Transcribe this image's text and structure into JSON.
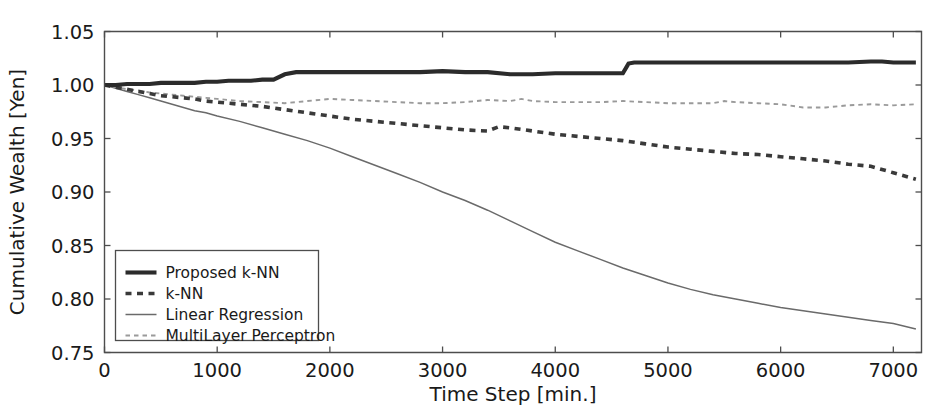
{
  "chart_data": {
    "type": "line",
    "title": "",
    "xlabel": "Time Step [min.]",
    "ylabel": "Cumulative Wealth [Yen]",
    "xlim": [
      0,
      7250
    ],
    "ylim": [
      0.75,
      1.05
    ],
    "xticks": [
      0,
      1000,
      2000,
      3000,
      4000,
      5000,
      6000,
      7000
    ],
    "xticklabels": [
      "0",
      "1000",
      "2000",
      "3000",
      "4000",
      "5000",
      "6000",
      "7000"
    ],
    "yticks": [
      0.75,
      0.8,
      0.85,
      0.9,
      0.95,
      1.0,
      1.05
    ],
    "yticklabels": [
      "0.75",
      "0.80",
      "0.85",
      "0.90",
      "0.95",
      "1.00",
      "1.05"
    ],
    "grid": false,
    "legend_position": "lower left",
    "series": [
      {
        "name": "Proposed k-NN",
        "style": "solid-thick",
        "color": "#2b2b2b",
        "x": [
          0,
          100,
          200,
          300,
          400,
          500,
          600,
          700,
          800,
          900,
          1000,
          1100,
          1200,
          1300,
          1400,
          1500,
          1600,
          1700,
          1800,
          1900,
          2000,
          2200,
          2400,
          2600,
          2800,
          3000,
          3200,
          3400,
          3600,
          3800,
          4000,
          4200,
          4400,
          4600,
          4650,
          4700,
          4800,
          5000,
          5200,
          5400,
          5600,
          5800,
          6000,
          6200,
          6400,
          6600,
          6800,
          6900,
          7000,
          7100,
          7200
        ],
        "y": [
          1.0,
          1.0,
          1.001,
          1.001,
          1.001,
          1.002,
          1.002,
          1.002,
          1.002,
          1.003,
          1.003,
          1.004,
          1.004,
          1.004,
          1.005,
          1.005,
          1.01,
          1.012,
          1.012,
          1.012,
          1.012,
          1.012,
          1.012,
          1.012,
          1.012,
          1.013,
          1.012,
          1.012,
          1.01,
          1.01,
          1.011,
          1.011,
          1.011,
          1.011,
          1.02,
          1.021,
          1.021,
          1.021,
          1.021,
          1.021,
          1.021,
          1.021,
          1.021,
          1.021,
          1.021,
          1.021,
          1.022,
          1.022,
          1.021,
          1.021,
          1.021
        ]
      },
      {
        "name": "k-NN",
        "style": "dashed-thick",
        "color": "#3a3a3a",
        "x": [
          0,
          100,
          200,
          300,
          400,
          500,
          600,
          700,
          800,
          900,
          1000,
          1200,
          1400,
          1600,
          1800,
          2000,
          2200,
          2400,
          2600,
          2800,
          3000,
          3200,
          3400,
          3500,
          3600,
          3800,
          4000,
          4200,
          4400,
          4600,
          4800,
          5000,
          5200,
          5400,
          5600,
          5800,
          6000,
          6200,
          6400,
          6600,
          6800,
          7000,
          7100,
          7200
        ],
        "y": [
          1.0,
          0.998,
          0.996,
          0.994,
          0.992,
          0.99,
          0.989,
          0.988,
          0.987,
          0.985,
          0.984,
          0.982,
          0.98,
          0.977,
          0.974,
          0.971,
          0.968,
          0.966,
          0.964,
          0.962,
          0.96,
          0.958,
          0.957,
          0.961,
          0.96,
          0.957,
          0.954,
          0.952,
          0.95,
          0.948,
          0.945,
          0.942,
          0.94,
          0.938,
          0.936,
          0.935,
          0.933,
          0.931,
          0.929,
          0.926,
          0.924,
          0.918,
          0.915,
          0.912
        ]
      },
      {
        "name": "Linear Regression",
        "style": "solid-thin",
        "color": "#6a6a6a",
        "x": [
          0,
          100,
          200,
          300,
          400,
          500,
          600,
          700,
          800,
          900,
          1000,
          1200,
          1400,
          1600,
          1800,
          2000,
          2200,
          2400,
          2600,
          2800,
          3000,
          3200,
          3400,
          3600,
          3800,
          4000,
          4200,
          4400,
          4600,
          4800,
          5000,
          5200,
          5400,
          5600,
          5800,
          6000,
          6200,
          6400,
          6600,
          6800,
          7000,
          7200
        ],
        "y": [
          1.0,
          0.997,
          0.994,
          0.991,
          0.988,
          0.985,
          0.982,
          0.979,
          0.976,
          0.974,
          0.971,
          0.966,
          0.96,
          0.954,
          0.948,
          0.941,
          0.933,
          0.925,
          0.917,
          0.909,
          0.9,
          0.892,
          0.883,
          0.873,
          0.863,
          0.853,
          0.845,
          0.837,
          0.829,
          0.822,
          0.815,
          0.809,
          0.804,
          0.8,
          0.796,
          0.792,
          0.789,
          0.786,
          0.783,
          0.78,
          0.777,
          0.772
        ]
      },
      {
        "name": "MultiLayer Perceptron",
        "style": "dashed-thin",
        "color": "#9a9a9a",
        "x": [
          0,
          100,
          200,
          300,
          400,
          500,
          600,
          700,
          800,
          900,
          1000,
          1200,
          1400,
          1600,
          1800,
          2000,
          2200,
          2400,
          2600,
          2800,
          3000,
          3200,
          3400,
          3600,
          3700,
          3800,
          4000,
          4200,
          4400,
          4600,
          4800,
          5000,
          5200,
          5400,
          5500,
          5600,
          5800,
          6000,
          6200,
          6400,
          6600,
          6800,
          7000,
          7200
        ],
        "y": [
          1.0,
          0.998,
          0.996,
          0.995,
          0.993,
          0.992,
          0.991,
          0.99,
          0.989,
          0.988,
          0.987,
          0.985,
          0.984,
          0.983,
          0.985,
          0.987,
          0.986,
          0.985,
          0.984,
          0.983,
          0.983,
          0.984,
          0.986,
          0.985,
          0.987,
          0.985,
          0.984,
          0.984,
          0.984,
          0.985,
          0.984,
          0.983,
          0.983,
          0.983,
          0.985,
          0.984,
          0.983,
          0.982,
          0.979,
          0.979,
          0.981,
          0.982,
          0.981,
          0.982
        ]
      }
    ]
  },
  "legend": {
    "entries": [
      {
        "label": "Proposed k-NN"
      },
      {
        "label": "k-NN"
      },
      {
        "label": "Linear Regression"
      },
      {
        "label": "MultiLayer Perceptron"
      }
    ]
  },
  "colors": {
    "background": "#ffffff",
    "axis": "#4d4d4d",
    "text": "#1a1a1a"
  }
}
